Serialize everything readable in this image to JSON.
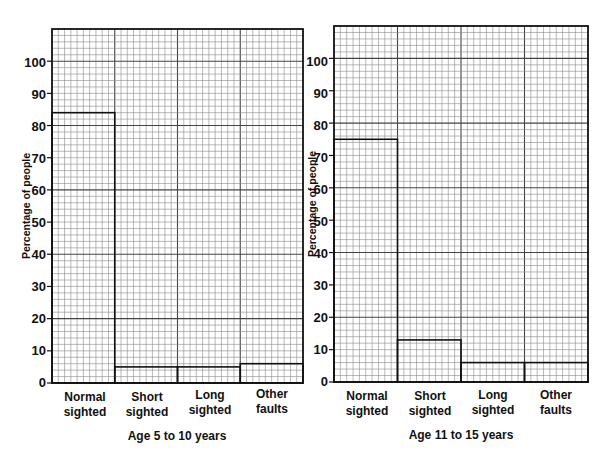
{
  "chart_data": [
    {
      "type": "bar",
      "title": "",
      "subtitle": "Age 5 to 10 years",
      "xlabel": "Age 5 to 10 years",
      "ylabel": "Percentage of people",
      "categories": [
        "Normal sighted",
        "Short sighted",
        "Long sighted",
        "Other faults"
      ],
      "category_lines": [
        [
          "Normal",
          "sighted"
        ],
        [
          "Short",
          "sighted"
        ],
        [
          "Long",
          "sighted"
        ],
        [
          "Other",
          "faults"
        ]
      ],
      "values": [
        84,
        5,
        5,
        6
      ],
      "ylim": [
        0,
        110
      ],
      "yticks": [
        0,
        10,
        20,
        30,
        40,
        50,
        60,
        70,
        80,
        90,
        100
      ],
      "grid": true
    },
    {
      "type": "bar",
      "title": "",
      "subtitle": "Age 11 to 15 years",
      "xlabel": "Age 11 to 15 years",
      "ylabel": "Percentage of people",
      "categories": [
        "Normal sighted",
        "Short sighted",
        "Long sighted",
        "Other faults"
      ],
      "category_lines": [
        [
          "Normal",
          "sighted"
        ],
        [
          "Short",
          "sighted"
        ],
        [
          "Long",
          "sighted"
        ],
        [
          "Other",
          "faults"
        ]
      ],
      "values": [
        75,
        13,
        6,
        6
      ],
      "ylim": [
        0,
        110
      ],
      "yticks": [
        0,
        10,
        20,
        30,
        40,
        50,
        60,
        70,
        80,
        90,
        100
      ],
      "grid": true
    }
  ],
  "charts": [
    {
      "ylabel": "Percentage of people",
      "subtitle": "Age 5 to 10 years",
      "yticks": [
        "0",
        "10",
        "20",
        "30",
        "40",
        "50",
        "60",
        "70",
        "80",
        "90",
        "100"
      ],
      "categories": [
        {
          "line1": "Normal",
          "line2": "sighted"
        },
        {
          "line1": "Short",
          "line2": "sighted"
        },
        {
          "line1": "Long",
          "line2": "sighted"
        },
        {
          "line1": "Other",
          "line2": "faults"
        }
      ]
    },
    {
      "ylabel": "Percentage of people",
      "subtitle": "Age 11 to 15 years",
      "yticks": [
        "0",
        "10",
        "20",
        "30",
        "40",
        "50",
        "60",
        "70",
        "80",
        "90",
        "100"
      ],
      "categories": [
        {
          "line1": "Normal",
          "line2": "sighted"
        },
        {
          "line1": "Short",
          "line2": "sighted"
        },
        {
          "line1": "Long",
          "line2": "sighted"
        },
        {
          "line1": "Other",
          "line2": "faults"
        }
      ]
    }
  ],
  "colors": {
    "grid_minor": "#8a8a8a",
    "grid_major": "#444444",
    "frame": "#111111",
    "bar_outline": "#111111",
    "text": "#111111"
  }
}
